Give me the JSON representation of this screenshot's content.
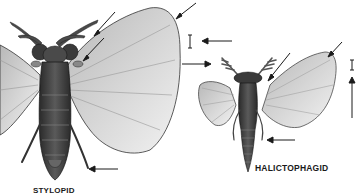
{
  "figure": {
    "specimens": [
      {
        "id": "left",
        "label": "STYLOPID",
        "label_visible_partial": true,
        "description": "Male stylopid (Strepsiptera) dorsal view with fan-shaped hindwings, branched antennae, large compound eyes"
      },
      {
        "id": "right",
        "label": "HALICTOPHAGID",
        "description": "Male halictophagid (Strepsiptera) dorsal view with fan-shaped hindwings, pectinate antennae, elongate abdomen"
      }
    ],
    "scale_bars": [
      {
        "specimen": "left",
        "glyph": "I"
      },
      {
        "specimen": "right",
        "glyph": "I"
      }
    ],
    "arrows_count": 9,
    "colors": {
      "background": "#ffffff",
      "ink": "#1a1a1a",
      "body_dark": "#3a3a3a",
      "wing_light": "#d8d8d8"
    }
  }
}
